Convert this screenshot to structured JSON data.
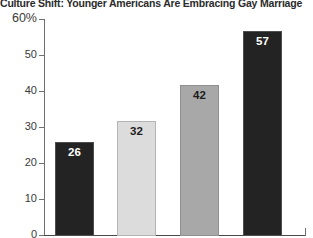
{
  "chart_data": {
    "type": "bar",
    "title": "Culture Shift: Younger Americans Are Embracing Gay Marriage",
    "xlabel": "",
    "ylabel": "",
    "ylim": [
      0,
      60
    ],
    "grid": false,
    "legend": "none",
    "categories": [
      "",
      "",
      "",
      ""
    ],
    "values": [
      26,
      32,
      42,
      57
    ],
    "value_labels": [
      "26",
      "32",
      "42",
      "57"
    ],
    "bar_colors": [
      "#232323",
      "#dcdcdc",
      "#a8a8a8",
      "#232323"
    ],
    "ytick_labels": [
      "60%",
      "50",
      "40",
      "30",
      "20",
      "10",
      "0"
    ],
    "ytick_values": [
      60,
      50,
      40,
      30,
      20,
      10,
      0
    ]
  },
  "axis": {
    "y": {
      "ticks": [
        {
          "label": "60%",
          "value": 60
        },
        {
          "label": "50",
          "value": 50
        },
        {
          "label": "40",
          "value": 40
        },
        {
          "label": "30",
          "value": 30
        },
        {
          "label": "20",
          "value": 20
        },
        {
          "label": "10",
          "value": 10
        },
        {
          "label": "0",
          "value": 0
        }
      ]
    }
  },
  "bars": [
    {
      "value_label": "26",
      "value": 26,
      "style": "bar-dark"
    },
    {
      "value_label": "32",
      "value": 32,
      "style": "bar-light"
    },
    {
      "value_label": "42",
      "value": 42,
      "style": "bar-mid"
    },
    {
      "value_label": "57",
      "value": 57,
      "style": "bar-dark"
    }
  ]
}
